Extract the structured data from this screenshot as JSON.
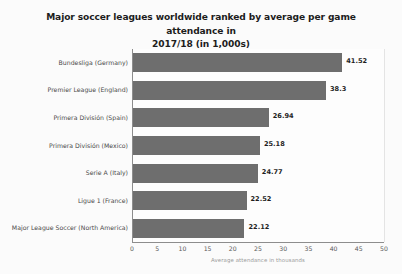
{
  "chart_data": {
    "type": "bar",
    "orientation": "horizontal",
    "title": "Major soccer leagues worldwide ranked by average per game attendance in 2017/18 (in 1,000s)",
    "title_line1": "Major soccer leagues worldwide ranked by average per game attendance in",
    "title_line2": "2017/18 (in 1,000s)",
    "xlabel": "Average attendance in thousands",
    "ylabel": "",
    "categories": [
      "Bundesliga (Germany)",
      "Premier League (England)",
      "Primera División (Spain)",
      "Primera División (Mexico)",
      "Serie A (Italy)",
      "Ligue 1 (France)",
      "Major League Soccer (North America)"
    ],
    "values": [
      41.52,
      38.3,
      26.94,
      25.18,
      24.77,
      22.52,
      22.12
    ],
    "value_labels": [
      "41.52",
      "38.3",
      "26.94",
      "25.18",
      "24.77",
      "22.52",
      "22.12"
    ],
    "xlim": [
      0,
      50
    ],
    "xticks": [
      0,
      5,
      10,
      15,
      20,
      25,
      30,
      35,
      40,
      45,
      50
    ],
    "xtick_labels": [
      "0",
      "5",
      "10",
      "15",
      "20",
      "25",
      "30",
      "35",
      "40",
      "45",
      "50"
    ],
    "grid": "vertical",
    "legend": null,
    "colors": {
      "bar": "#6e6e6e",
      "background": "#fbfbfb",
      "plot_background": "#fdfdfd",
      "gridline": "#e4e4e4",
      "axis": "#8d8d8d",
      "title_text": "#1d1d1d",
      "category_text": "#4a4a4a",
      "tick_text": "#5a5a5a",
      "value_text": "#1f1f1f",
      "axis_title_text": "#9a9a9a"
    }
  }
}
